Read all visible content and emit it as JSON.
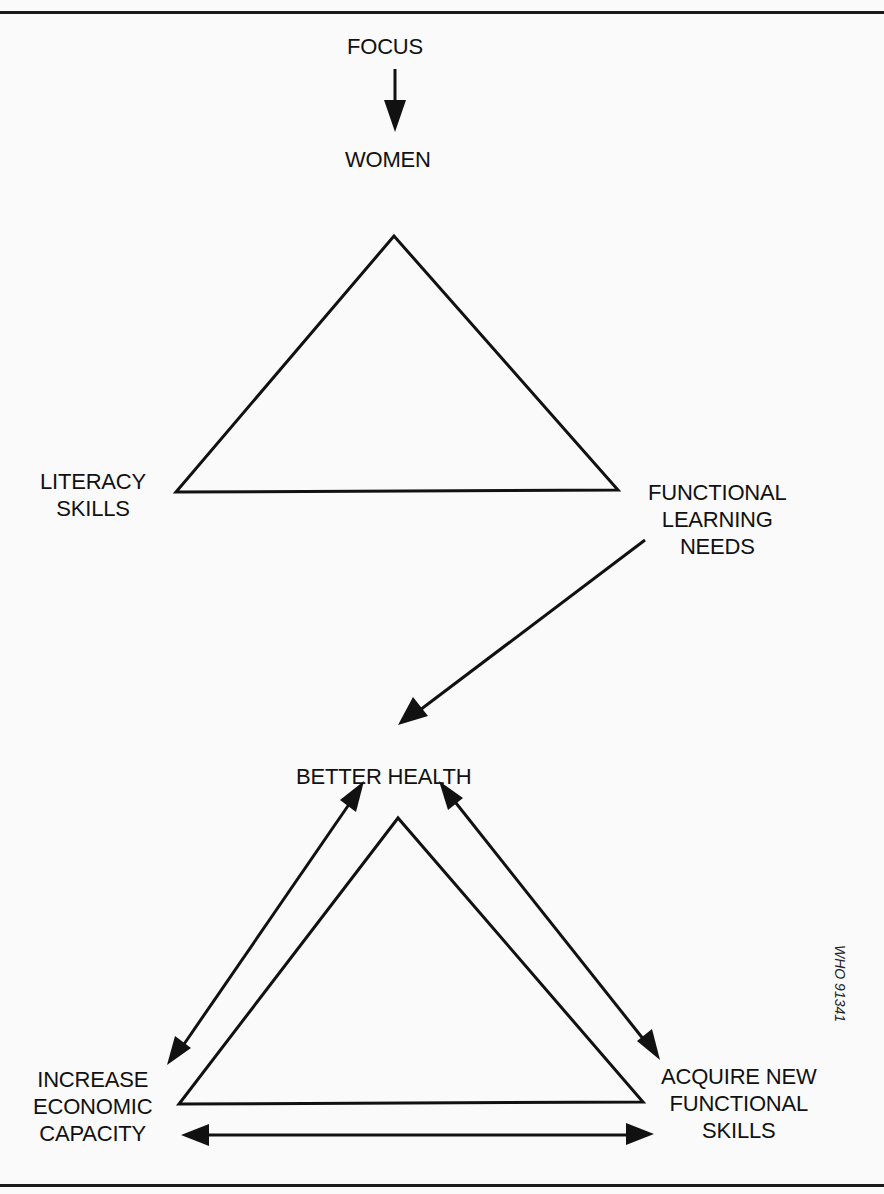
{
  "diagram": {
    "top_flow": {
      "source": "FOCUS",
      "target": "WOMEN"
    },
    "upper_triangle": {
      "apex_label": "WOMEN",
      "left_vertex": {
        "lines": [
          "LITERACY",
          "SKILLS"
        ]
      },
      "right_vertex": {
        "lines": [
          "FUNCTIONAL",
          "LEARNING",
          "NEEDS"
        ]
      }
    },
    "connector": {
      "from": "FUNCTIONAL LEARNING NEEDS",
      "to": "BETTER HEALTH"
    },
    "lower_triangle": {
      "apex": {
        "label": "BETTER HEALTH"
      },
      "left_vertex": {
        "lines": [
          "INCREASE",
          "ECONOMIC",
          "CAPACITY"
        ]
      },
      "right_vertex": {
        "lines": [
          "ACQUIRE NEW",
          "FUNCTIONAL",
          "SKILLS"
        ]
      },
      "relationships": [
        {
          "between": [
            "BETTER HEALTH",
            "INCREASE ECONOMIC CAPACITY"
          ],
          "type": "bidirectional"
        },
        {
          "between": [
            "BETTER HEALTH",
            "ACQUIRE NEW FUNCTIONAL SKILLS"
          ],
          "type": "bidirectional"
        },
        {
          "between": [
            "INCREASE ECONOMIC CAPACITY",
            "ACQUIRE NEW FUNCTIONAL SKILLS"
          ],
          "type": "bidirectional"
        }
      ]
    },
    "reference_code": "WHO 91341"
  },
  "colors": {
    "ink": "#111111",
    "background": "#fafafa"
  }
}
